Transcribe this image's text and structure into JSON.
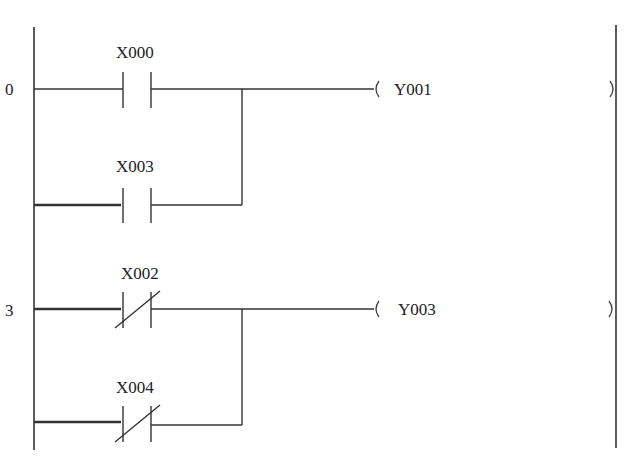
{
  "diagram": {
    "type": "plc-ladder-diagram",
    "rungs": [
      {
        "step": "0",
        "branches": [
          {
            "contact": "X000",
            "contact_type": "normally-open"
          },
          {
            "contact": "X003",
            "contact_type": "normally-open"
          }
        ],
        "coil": "Y001"
      },
      {
        "step": "3",
        "branches": [
          {
            "contact": "X002",
            "contact_type": "normally-closed"
          },
          {
            "contact": "X004",
            "contact_type": "normally-closed"
          }
        ],
        "coil": "Y003"
      }
    ]
  }
}
